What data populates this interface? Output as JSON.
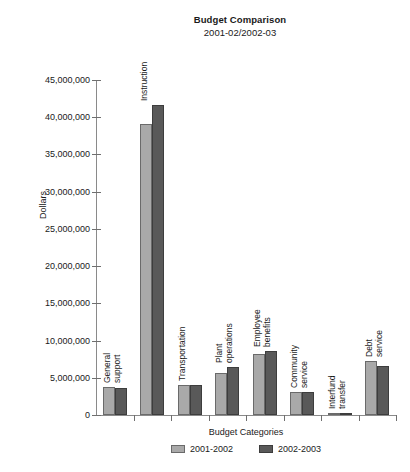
{
  "chart_data": {
    "type": "bar",
    "title": "Budget Comparison",
    "subtitle": "2001-02/2002-03",
    "xlabel": "Budget Categories",
    "ylabel": "Dollars",
    "ylim": [
      0,
      45000000
    ],
    "ytick_step": 5000000,
    "grid": false,
    "legend_position": "bottom",
    "ytick_labels": [
      "45,000,000",
      "40,000,000",
      "35,000,000",
      "30,000,000",
      "25,000,000",
      "20,000,000",
      "15,000,000",
      "10,000,000",
      "5,000,000",
      "0"
    ],
    "ytick_values": [
      45000000,
      40000000,
      35000000,
      30000000,
      25000000,
      20000000,
      15000000,
      10000000,
      5000000,
      0
    ],
    "categories": [
      "General support",
      "Instruction",
      "Transportation",
      "Plant operations",
      "Employee benefits",
      "Community service",
      "Interfund transfer",
      "Debt service"
    ],
    "category_label_lines": [
      [
        "General",
        "support"
      ],
      [
        "Instruction"
      ],
      [
        "Transportation"
      ],
      [
        "Plant",
        "operations"
      ],
      [
        "Employee",
        "benefits"
      ],
      [
        "Community",
        "service"
      ],
      [
        "Interfund",
        "transfer"
      ],
      [
        "Debt",
        "service"
      ]
    ],
    "series": [
      {
        "name": "2001-2002",
        "color": "#a9a9a9",
        "values": [
          3700000,
          39100000,
          4050000,
          5700000,
          8200000,
          3100000,
          200000,
          7200000
        ]
      },
      {
        "name": "2002-2003",
        "color": "#595959",
        "values": [
          3600000,
          41700000,
          4050000,
          6500000,
          8600000,
          3050000,
          250000,
          6600000
        ]
      }
    ]
  },
  "legend": {
    "items": [
      {
        "label": "2001-2002"
      },
      {
        "label": "2002-2003"
      }
    ]
  }
}
